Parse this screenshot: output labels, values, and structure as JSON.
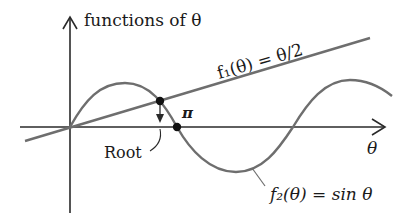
{
  "diagram": {
    "y_axis_label": "functions of θ",
    "x_axis_label": "θ",
    "line_label": "f₁(θ) = θ/2",
    "curve_label": "f₂(θ) = sin θ",
    "pi_label": "π",
    "root_label": "Root",
    "colors": {
      "axes": "#2a2a2a",
      "curves": "#6e6e6e",
      "points": "#111111",
      "text": "#1a1a1a"
    }
  }
}
